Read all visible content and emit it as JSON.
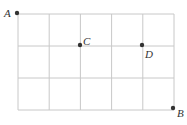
{
  "diagram": {
    "type": "grid",
    "columns": 5,
    "rows": 3,
    "grid": {
      "left": 18,
      "top": 14,
      "right": 174,
      "bottom": 110
    },
    "line_color": "#c8c8c8",
    "point_color": "#333333",
    "points": [
      {
        "label": "A",
        "x": 17,
        "y": 13,
        "label_x": 4,
        "label_y": 17
      },
      {
        "label": "C",
        "x": 80,
        "y": 45,
        "label_x": 83,
        "label_y": 45
      },
      {
        "label": "D",
        "x": 142,
        "y": 45,
        "label_x": 145,
        "label_y": 58
      },
      {
        "label": "B",
        "x": 173,
        "y": 108,
        "label_x": 177,
        "label_y": 117
      }
    ]
  }
}
